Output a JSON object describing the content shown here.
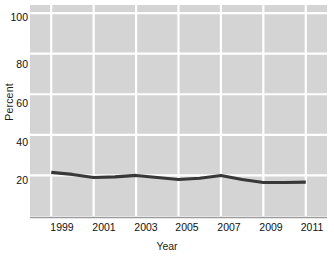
{
  "chart_data": {
    "type": "line",
    "title": "",
    "xlabel": "Year",
    "ylabel": "Percent",
    "xlim": [
      1998,
      2012
    ],
    "ylim": [
      0,
      104
    ],
    "grid": true,
    "legend": "none",
    "plot_background": "#d4d4d4",
    "gridline_color": "#ffffff",
    "line_color": "#383838",
    "axis_color": "#9a9a9a",
    "x_ticks": [
      "1999",
      "2001",
      "2003",
      "2005",
      "2007",
      "2009",
      "2011"
    ],
    "y_ticks": [
      "20",
      "40",
      "60",
      "80",
      "100"
    ],
    "x": [
      1999,
      2000,
      2001,
      2002,
      2003,
      2004,
      2005,
      2006,
      2007,
      2008,
      2009,
      2010,
      2011
    ],
    "values": [
      21.5,
      20.5,
      19.0,
      19.3,
      20.0,
      19.0,
      18.0,
      18.6,
      20.0,
      18.0,
      16.5,
      16.5,
      16.7
    ],
    "series": [
      {
        "name": "Percent",
        "values": [
          21.5,
          20.5,
          19.0,
          19.3,
          20.0,
          19.0,
          18.0,
          18.6,
          20.0,
          18.0,
          16.5,
          16.5,
          16.7
        ]
      }
    ]
  }
}
